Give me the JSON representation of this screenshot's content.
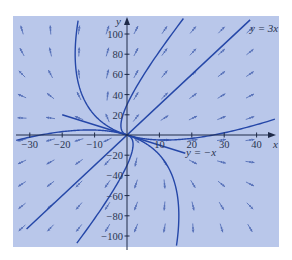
{
  "chart_data": {
    "type": "phase-portrait",
    "title": "",
    "xlabel": "x",
    "ylabel": "y",
    "xlim": [
      -34,
      46
    ],
    "ylim": [
      -112,
      115
    ],
    "x_ticks": [
      -30,
      -20,
      -10,
      10,
      20,
      30,
      40
    ],
    "x_tick_labels": [
      "−30",
      "−20",
      "−10",
      "10",
      "20",
      "30",
      "40"
    ],
    "y_ticks": [
      -100,
      -80,
      -60,
      -40,
      -20,
      20,
      40,
      60,
      80,
      100
    ],
    "y_tick_labels": [
      "−100",
      "−80",
      "−60",
      "−40",
      "−20",
      "20",
      "40",
      "60",
      "80",
      "100"
    ],
    "system_matrix": [
      [
        1.25,
        0.25
      ],
      [
        0.75,
        1.75
      ]
    ],
    "eigen_lines": [
      {
        "label": "y = 3x",
        "slope": 3
      },
      {
        "label": "y = −x",
        "slope": -1
      }
    ],
    "trajectories": [
      {
        "name": "y-equals-3x-line",
        "points": [
          [
            -31,
            -93
          ],
          [
            38,
            114
          ]
        ]
      },
      {
        "name": "y-equals-neg-x-line",
        "points": [
          [
            -20,
            20
          ],
          [
            18,
            -18
          ]
        ]
      },
      {
        "name": "trajectory-a",
        "points": [
          [
            -22,
            -40
          ],
          [
            0,
            0
          ],
          [
            22,
            48
          ]
        ]
      },
      {
        "name": "trajectory-b",
        "points": [
          [
            -25,
            -75
          ],
          [
            0,
            0
          ],
          [
            25,
            60
          ]
        ]
      },
      {
        "name": "trajectory-c",
        "points": [
          [
            -20,
            -70
          ],
          [
            0,
            0
          ],
          [
            20,
            35
          ]
        ]
      },
      {
        "name": "trajectory-d",
        "points": [
          [
            -5,
            18
          ],
          [
            0,
            0
          ],
          [
            12,
            75
          ]
        ]
      },
      {
        "name": "trajectory-e",
        "points": [
          [
            5,
            -18
          ],
          [
            0,
            0
          ],
          [
            -12,
            -75
          ]
        ]
      }
    ],
    "grid": false,
    "background_color": "#b9c7ea",
    "curve_color": "#2547a8",
    "arrow_color": "#5670b8"
  }
}
